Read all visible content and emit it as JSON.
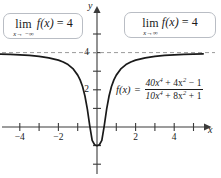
{
  "figure": {
    "background": "#ffffff",
    "curve_color": "#1a1a1a",
    "axis_color": "#3a3a3a",
    "asymptote_color": "#8a8a8a",
    "box_border_color": "#b9bdc4"
  },
  "limit_left": {
    "lim_word": "lim",
    "subscript": "x→ −∞",
    "function": "f(x)",
    "equals": "=",
    "value": "4"
  },
  "limit_right": {
    "lim_word": "lim",
    "subscript": "x→∞",
    "function": "f(x)",
    "equals": "=",
    "value": "4"
  },
  "formula": {
    "fx_label": "f(x)",
    "equals": "=",
    "numerator_terms": [
      "40x",
      "4",
      " + 4x",
      "2",
      " − 1"
    ],
    "denominator_terms": [
      "10x",
      "4",
      " + 8x",
      "2",
      " + 1"
    ],
    "numerator_plain": "40x⁴ + 4x² − 1",
    "denominator_plain": "10x⁴ + 8x² + 1",
    "numer_a": "40x",
    "numer_a_exp": "4",
    "numer_b": " + 4x",
    "numer_b_exp": "2",
    "numer_c": " − 1",
    "denom_a": "10x",
    "denom_a_exp": "4",
    "denom_b": " + 8x",
    "denom_b_exp": "2",
    "denom_c": " + 1"
  },
  "axes": {
    "x_label": "x",
    "y_label": "y",
    "x_tick_labels": [
      {
        "value": -4,
        "text": "−4"
      },
      {
        "value": -2,
        "text": "−2"
      },
      {
        "value": 2,
        "text": "2"
      },
      {
        "value": 4,
        "text": "4"
      }
    ],
    "y_tick_labels": [
      {
        "value": 2,
        "text": "2"
      },
      {
        "value": 4,
        "text": "4"
      }
    ]
  },
  "chart_data": {
    "type": "line",
    "title": "",
    "xlabel": "x",
    "ylabel": "y",
    "xlim": [
      -5.6,
      5.6
    ],
    "ylim": [
      -2.6,
      5.8
    ],
    "grid": false,
    "legend": false,
    "function_expression": "(40x^4 + 4x^2 - 1)/(10x^4 + 8x^2 + 1)",
    "asymptote": {
      "type": "horizontal",
      "y": 4,
      "style": "dashed",
      "label": "y = 4"
    },
    "xticks": [
      -5,
      -4,
      -3,
      -2,
      -1,
      1,
      2,
      3,
      4,
      5
    ],
    "yticks": [
      -2,
      -1,
      1,
      2,
      3,
      4,
      5
    ],
    "annotations": [
      "lim x→−∞ f(x) = 4",
      "lim x→∞ f(x) = 4",
      "f(x) = (40x⁴ + 4x² − 1)/(10x⁴ + 8x² + 1)"
    ],
    "key_points": [
      {
        "x": -5.5,
        "y": 3.932
      },
      {
        "x": -5.0,
        "y": 3.92
      },
      {
        "x": -4.5,
        "y": 3.903
      },
      {
        "x": -4.0,
        "y": 3.88
      },
      {
        "x": -3.5,
        "y": 3.847
      },
      {
        "x": -3.0,
        "y": 3.797
      },
      {
        "x": -2.5,
        "y": 3.72
      },
      {
        "x": -2.0,
        "y": 3.593
      },
      {
        "x": -1.75,
        "y": 3.495
      },
      {
        "x": -1.5,
        "y": 3.355
      },
      {
        "x": -1.25,
        "y": 3.139
      },
      {
        "x": -1.0,
        "y": 2.789
      },
      {
        "x": -0.875,
        "y": 2.532
      },
      {
        "x": -0.75,
        "y": 2.176
      },
      {
        "x": -0.625,
        "y": 1.666
      },
      {
        "x": -0.5,
        "y": 0.962
      },
      {
        "x": -0.375,
        "y": 0.06
      },
      {
        "x": -0.25,
        "y": -0.723
      },
      {
        "x": -0.125,
        "y": -0.954
      },
      {
        "x": 0.0,
        "y": -1.0
      },
      {
        "x": 0.125,
        "y": -0.954
      },
      {
        "x": 0.25,
        "y": -0.723
      },
      {
        "x": 0.375,
        "y": 0.06
      },
      {
        "x": 0.5,
        "y": 0.962
      },
      {
        "x": 0.625,
        "y": 1.666
      },
      {
        "x": 0.75,
        "y": 2.176
      },
      {
        "x": 0.875,
        "y": 2.532
      },
      {
        "x": 1.0,
        "y": 2.789
      },
      {
        "x": 1.25,
        "y": 3.139
      },
      {
        "x": 1.5,
        "y": 3.355
      },
      {
        "x": 1.75,
        "y": 3.495
      },
      {
        "x": 2.0,
        "y": 3.593
      },
      {
        "x": 2.5,
        "y": 3.72
      },
      {
        "x": 3.0,
        "y": 3.797
      },
      {
        "x": 3.5,
        "y": 3.847
      },
      {
        "x": 4.0,
        "y": 3.88
      },
      {
        "x": 4.5,
        "y": 3.903
      },
      {
        "x": 5.0,
        "y": 3.92
      },
      {
        "x": 5.5,
        "y": 3.932
      }
    ]
  }
}
